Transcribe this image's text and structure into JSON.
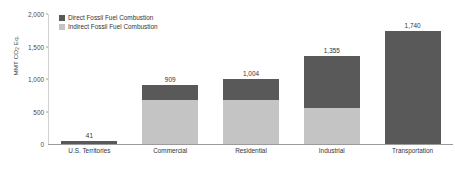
{
  "chart_data": {
    "type": "bar",
    "subtype": "stacked-bar",
    "title": "",
    "xlabel": "",
    "ylabel": "MMT CO2 Eq.",
    "ylabel_parts": {
      "prefix": "MMT CO",
      "sub": "2",
      "suffix": " Eq."
    },
    "ylim": [
      0,
      2000
    ],
    "yticks": [
      0,
      500,
      1000,
      1500,
      2000
    ],
    "ytick_labels": [
      "0",
      "500",
      "1,000",
      "1,500",
      "2,000"
    ],
    "grid": false,
    "legend_position": "top-left-inside",
    "categories": [
      "U.S. Territories",
      "Commercial",
      "Residential",
      "Industrial",
      "Transportation"
    ],
    "totals": [
      41,
      909,
      1004,
      1355,
      1740
    ],
    "total_labels": [
      "41",
      "909",
      "1,004",
      "1,355",
      "1,740"
    ],
    "series": [
      {
        "name": "Direct Fossil Fuel Combustion",
        "color": "#595959",
        "values": [
          41,
          227,
          331,
          800,
          1740
        ]
      },
      {
        "name": "Indirect Fossil Fuel Combustion",
        "color": "#c4c4c4",
        "values": [
          0,
          682,
          673,
          555,
          0
        ]
      }
    ]
  },
  "legend": {
    "items": [
      {
        "label": "Direct Fossil Fuel Combustion",
        "color": "#595959"
      },
      {
        "label": "Indirect Fossil Fuel Combustion",
        "color": "#c4c4c4"
      }
    ]
  },
  "colors": {
    "direct": "#595959",
    "indirect": "#c4c4c4",
    "axis": "#9a9a9a",
    "text": "#333333",
    "background": "#ffffff"
  }
}
